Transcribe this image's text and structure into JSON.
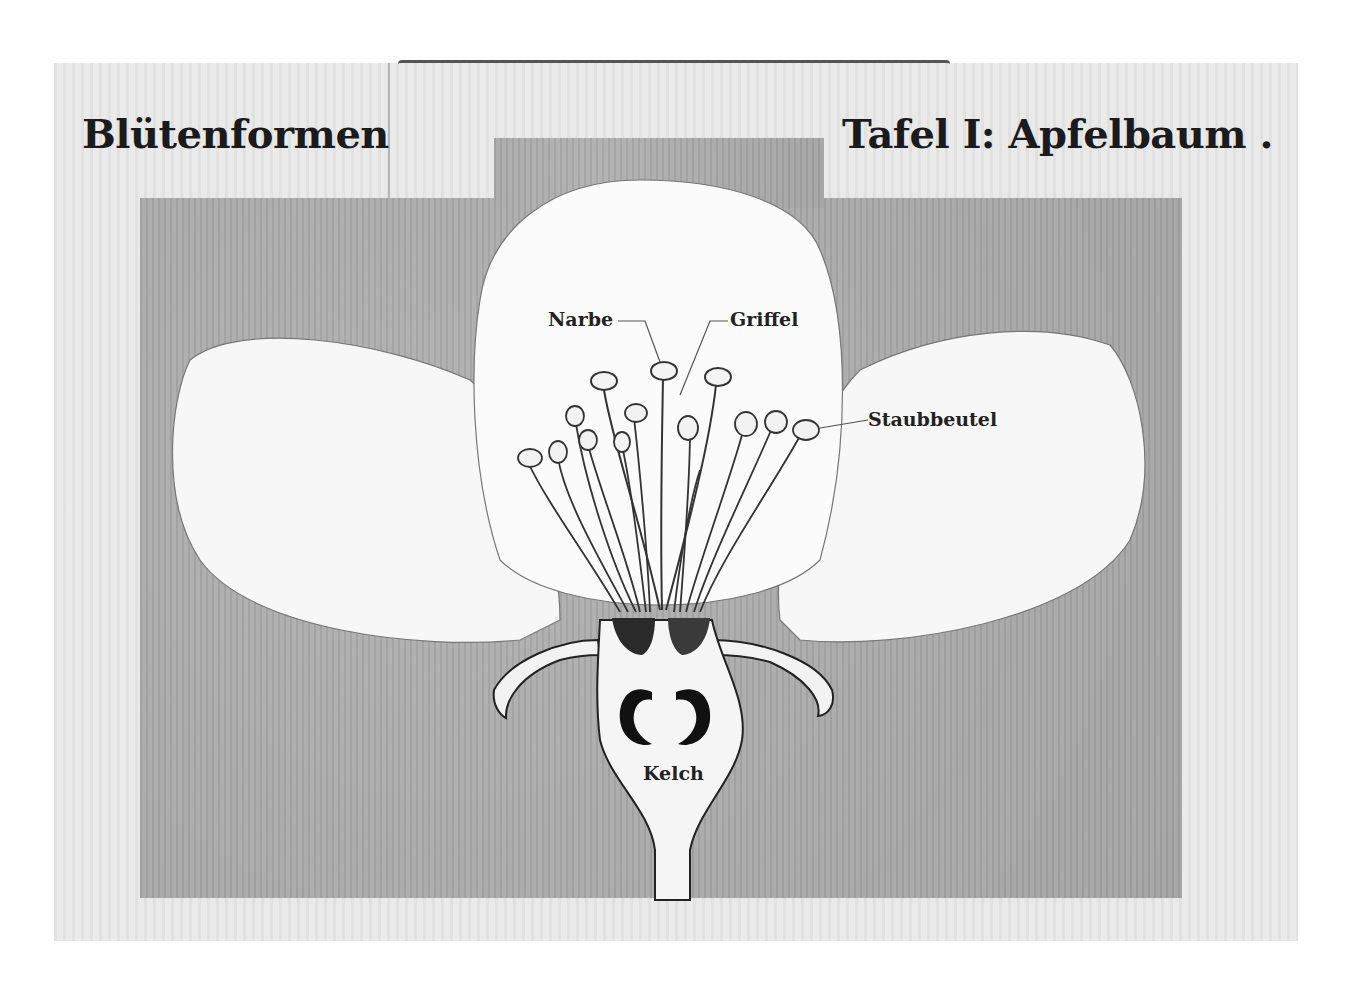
{
  "chart": {
    "title_left": "Blütenformen",
    "title_right": "Tafel I: Apfelbaum .",
    "labels": {
      "narbe": "Narbe",
      "griffel": "Griffel",
      "staubbeutel": "Staubbeutel",
      "kelch": "Kelch"
    }
  }
}
